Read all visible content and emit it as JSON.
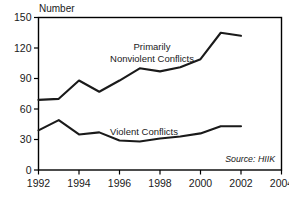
{
  "chart_data": {
    "type": "line",
    "title": "",
    "xlabel": "",
    "ylabel": "Number",
    "source": "Source: HIIK",
    "x": [
      1992,
      1993,
      1994,
      1995,
      1996,
      1997,
      1998,
      1999,
      2000,
      2001,
      2002
    ],
    "xlim": [
      1992,
      2004
    ],
    "ylim": [
      0,
      150
    ],
    "xticks": [
      1992,
      1994,
      1996,
      1998,
      2000,
      2002,
      2004
    ],
    "xtick_labels": [
      "1992",
      "1994",
      "1996",
      "1998",
      "2000",
      "2002",
      "2004"
    ],
    "yticks": [
      0,
      30,
      60,
      90,
      120,
      150
    ],
    "ytick_labels": [
      "0",
      "30",
      "60",
      "90",
      "120",
      "150"
    ],
    "grid": false,
    "legend_position": "inline-annotation",
    "series": [
      {
        "name": "Primarily Nonviolent Conflicts",
        "label_line1": "Primarily",
        "label_line2": "Nonviolent Conflicts",
        "values": [
          69,
          70,
          88,
          77,
          88,
          100,
          97,
          101,
          109,
          135,
          132
        ]
      },
      {
        "name": "Violent Conflicts",
        "label_line1": "Violent Conflicts",
        "label_line2": "",
        "values": [
          39,
          49,
          35,
          37,
          29,
          28,
          31,
          33,
          36,
          43,
          43
        ]
      }
    ]
  },
  "axis": {
    "y_title": "Number"
  },
  "annotations": {
    "nonviolent_line1": "Primarily",
    "nonviolent_line2": "Nonviolent Conflicts",
    "violent": "Violent Conflicts",
    "source": "Source: HIIK"
  }
}
